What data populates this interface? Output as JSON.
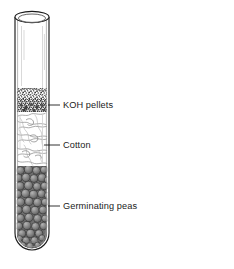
{
  "figure": {
    "background_color": "#ffffff",
    "ink_color": "#1b1b1b"
  },
  "apparatus": {
    "name": "test-tube",
    "glass_color": "#ffffff",
    "outline_color": "#1b1b1b",
    "mouth_label": "open rim",
    "bottom_label": "rounded base"
  },
  "layers": [
    {
      "id": "koh",
      "label": "KOH pellets",
      "fill_style": "stipple",
      "color": "#585858",
      "y_top": 88,
      "y_bottom": 112
    },
    {
      "id": "cotton",
      "label": "Cotton",
      "fill_style": "wispy",
      "color": "#ffffff",
      "y_top": 112,
      "y_bottom": 166
    },
    {
      "id": "peas",
      "label": "Germinating peas",
      "fill_style": "circles",
      "color": "#7d7d7d",
      "y_top": 166,
      "y_bottom": 250
    }
  ],
  "callouts": [
    {
      "id": "callout-koh",
      "label": "KOH pellets",
      "leader_y": 105,
      "leader_x_start": 48,
      "leader_x_end": 60,
      "text_x": 63
    },
    {
      "id": "callout-cotton",
      "label": "Cotton",
      "leader_y": 145,
      "leader_x_start": 44,
      "leader_x_end": 60,
      "text_x": 63
    },
    {
      "id": "callout-peas",
      "label": "Germinating peas",
      "leader_y": 206,
      "leader_x_start": 48,
      "leader_x_end": 60,
      "text_x": 63
    }
  ]
}
